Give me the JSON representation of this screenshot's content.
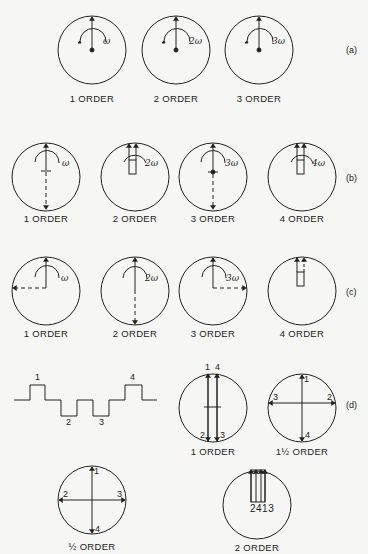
{
  "figure": {
    "rows": {
      "a": {
        "tag": "(a)",
        "items": [
          {
            "label": "1 ORDER",
            "speed": "ω"
          },
          {
            "label": "2 ORDER",
            "speed": "2ω"
          },
          {
            "label": "3 ORDER",
            "speed": "3ω"
          }
        ]
      },
      "b": {
        "tag": "(b)",
        "items": [
          {
            "label": "1 ORDER",
            "speed": "ω"
          },
          {
            "label": "2 ORDER",
            "speed": "2ω"
          },
          {
            "label": "3 ORDER",
            "speed": "3ω"
          },
          {
            "label": "4 ORDER",
            "speed": "4ω"
          }
        ]
      },
      "c": {
        "tag": "(c)",
        "items": [
          {
            "label": "1 ORDER",
            "speed": "ω"
          },
          {
            "label": "2 ORDER",
            "speed": "2ω"
          },
          {
            "label": "3 ORDER",
            "speed": "3ω"
          },
          {
            "label": "4 ORDER",
            "speed": ""
          }
        ]
      },
      "d": {
        "tag": "(d)",
        "waveform_labels": [
          "1",
          "2",
          "3",
          "4"
        ],
        "items": [
          {
            "label": "1 ORDER",
            "arrow_labels": [
              "1",
              "4",
              "2",
              "3"
            ]
          },
          {
            "label": "1½ ORDER",
            "arrow_labels": [
              "1",
              "2",
              "3",
              "4"
            ]
          },
          {
            "label": "½ ORDER",
            "arrow_labels": [
              "1",
              "2",
              "3",
              "4"
            ]
          },
          {
            "label": "2 ORDER",
            "arrow_labels": "2413"
          }
        ]
      }
    }
  }
}
